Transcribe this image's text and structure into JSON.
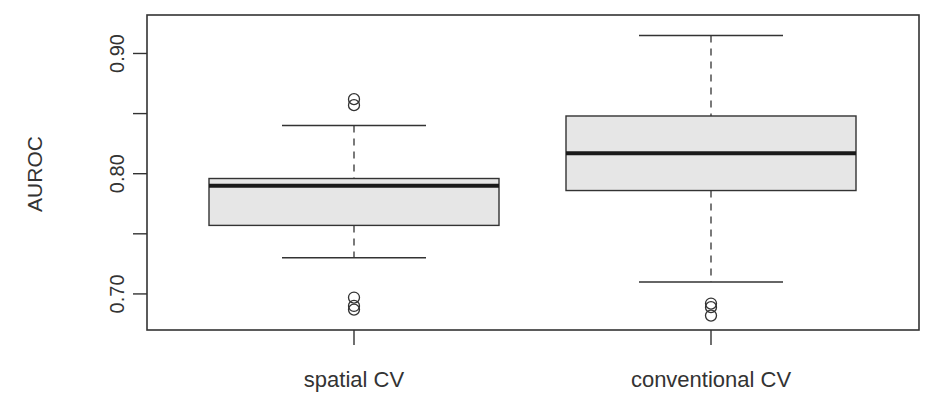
{
  "chart_data": {
    "type": "box",
    "title": "",
    "xlabel": "",
    "ylabel": "AUROC",
    "ylim": [
      0.67,
      0.932
    ],
    "yticks": [
      0.7,
      0.75,
      0.8,
      0.85,
      0.9
    ],
    "ytick_labels": [
      "0.70",
      "",
      "0.80",
      "",
      "0.90"
    ],
    "grid": false,
    "legend": null,
    "categories": [
      "spatial CV",
      "conventional CV"
    ],
    "boxes": [
      {
        "name": "spatial CV",
        "whisker_low": 0.73,
        "q1": 0.757,
        "median": 0.79,
        "q3": 0.796,
        "whisker_high": 0.84,
        "outliers": [
          0.862,
          0.857,
          0.697,
          0.69,
          0.687
        ]
      },
      {
        "name": "conventional CV",
        "whisker_low": 0.71,
        "q1": 0.786,
        "median": 0.817,
        "q3": 0.848,
        "whisker_high": 0.915,
        "outliers": [
          0.692,
          0.689,
          0.682
        ]
      }
    ],
    "colors": {
      "box_fill": "#e6e6e6",
      "line": "#333333",
      "median": "#1a1a1a"
    }
  }
}
